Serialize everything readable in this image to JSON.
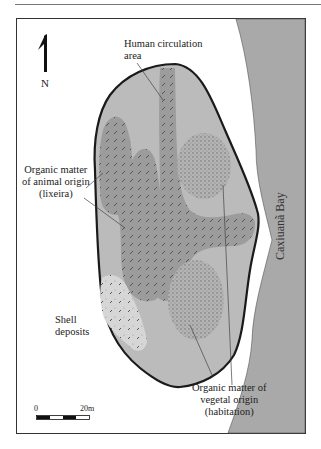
{
  "figure": {
    "type": "site map",
    "north_label": "N",
    "labels": {
      "human_circulation": [
        "Human circulation",
        "area"
      ],
      "animal_origin": [
        "Organic matter",
        "of animal origin",
        "(lixeira)"
      ],
      "shell_deposits": [
        "Shell",
        "deposits"
      ],
      "vegetal_origin": [
        "Organic matter of",
        "vegetal origin",
        "(habitation)"
      ],
      "bay": "Caxiuanã Bay"
    },
    "scale_bar": {
      "start": "0",
      "end": "20m"
    },
    "colors": {
      "site_fill": "#b9b9b9",
      "bay_fill": "#a9a9a9",
      "organic_animal": "#9a9a9a",
      "circulation": "#a2a2a2",
      "vegetal": "#a8a8a8",
      "shell": "#d4d4d4",
      "outline": "#1a1a1a"
    }
  }
}
